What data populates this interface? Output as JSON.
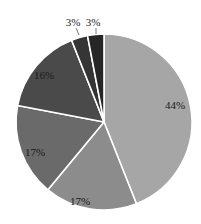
{
  "chart_data": {
    "type": "pie",
    "title": "",
    "start_angle_deg": 0,
    "direction": "clockwise",
    "slices": [
      {
        "label": "44%",
        "value": 44,
        "color": "#a6a6a6"
      },
      {
        "label": "17%",
        "value": 17,
        "color": "#8c8c8c"
      },
      {
        "label": "17%",
        "value": 17,
        "color": "#6a6a6a"
      },
      {
        "label": "16%",
        "value": 16,
        "color": "#4a4a4a"
      },
      {
        "label": "3%",
        "value": 3,
        "color": "#353535"
      },
      {
        "label": "3%",
        "value": 3,
        "color": "#262626"
      }
    ],
    "legend": null,
    "slice_border_color": "#ffffff"
  },
  "layout": {
    "cx": 104,
    "cy": 122,
    "r": 88,
    "label_positions": [
      {
        "x": 175,
        "y": 109
      },
      {
        "x": 80,
        "y": 205
      },
      {
        "x": 35,
        "y": 156
      },
      {
        "x": 44,
        "y": 79
      },
      {
        "x": 73,
        "y": 26
      },
      {
        "x": 93,
        "y": 26
      }
    ],
    "leader_lines": [
      null,
      null,
      null,
      null,
      {
        "x1": 76,
        "y1": 28,
        "x2": 79,
        "y2": 35
      },
      {
        "x1": 96,
        "y1": 28,
        "x2": 96,
        "y2": 34
      }
    ]
  }
}
